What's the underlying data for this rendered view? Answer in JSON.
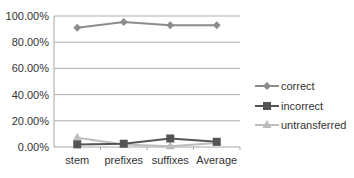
{
  "chart_data": {
    "type": "line",
    "title": "",
    "xlabel": "",
    "ylabel": "",
    "categories": [
      "stem",
      "prefixes",
      "suffixes",
      "Average"
    ],
    "ylim": [
      0,
      100
    ],
    "yticks": [
      "0.00%",
      "20.00%",
      "40.00%",
      "60.00%",
      "80.00%",
      "100.00%"
    ],
    "grid": true,
    "legend_position": "right",
    "series": [
      {
        "name": "correct",
        "values": [
          91.0,
          95.5,
          93.0,
          93.0
        ],
        "color": "#8c8c8c",
        "marker": "diamond"
      },
      {
        "name": "incorrect",
        "values": [
          2.0,
          2.5,
          6.5,
          4.0
        ],
        "color": "#555555",
        "marker": "square"
      },
      {
        "name": "untransferred",
        "values": [
          7.0,
          2.0,
          0.5,
          3.0
        ],
        "color": "#bdbdbd",
        "marker": "triangle"
      }
    ]
  }
}
